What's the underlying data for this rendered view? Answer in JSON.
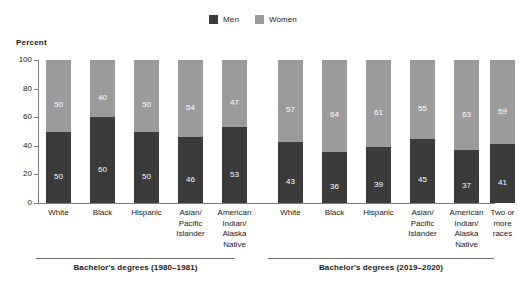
{
  "axis_title": "Percent",
  "legend": [
    {
      "label": "Men",
      "color": "#3b3b3b",
      "icon": "square-swatch-icon"
    },
    {
      "label": "Women",
      "color": "#9b9b9b",
      "icon": "square-swatch-icon"
    }
  ],
  "y_ticks": [
    "0",
    "20",
    "40",
    "60",
    "80",
    "100"
  ],
  "groups": [
    {
      "caption": "Bachelor's degrees (1980–1981)",
      "categories": [
        "White",
        "Black",
        "Hispanic",
        "Asian/\nPacific\nIslander",
        "American\nIndian/\nAlaska\nNative"
      ],
      "men": [
        50,
        60,
        50,
        46,
        53
      ],
      "women": [
        50,
        40,
        50,
        54,
        47
      ]
    },
    {
      "caption": "Bachelor's degrees (2019–2020)",
      "categories": [
        "White",
        "Black",
        "Hispanic",
        "Asian/\nPacific\nIslander",
        "American\nIndian/\nAlaska\nNative",
        "Two or\nmore\nraces"
      ],
      "men": [
        43,
        36,
        39,
        45,
        37,
        41
      ],
      "women": [
        57,
        64,
        61,
        55,
        63,
        59
      ]
    }
  ],
  "chart_data": {
    "type": "bar",
    "subtype": "stacked-100-percent-vertical",
    "title": "",
    "xlabel": "",
    "ylabel": "Percent",
    "ylim": [
      0,
      100
    ],
    "yticks": [
      0,
      20,
      40,
      60,
      80,
      100
    ],
    "grid": false,
    "legend_position": "top-center",
    "legend_entries": [
      "Men",
      "Women"
    ],
    "colors": {
      "Men": "#3b3b3b",
      "Women": "#9b9b9b"
    },
    "panels": [
      {
        "name": "Bachelor's degrees (1980–1981)",
        "categories": [
          "White",
          "Black",
          "Hispanic",
          "Asian/Pacific Islander",
          "American Indian/Alaska Native"
        ],
        "series": [
          {
            "name": "Men",
            "values": [
              50,
              60,
              50,
              46,
              53
            ]
          },
          {
            "name": "Women",
            "values": [
              50,
              40,
              50,
              54,
              47
            ]
          }
        ]
      },
      {
        "name": "Bachelor's degrees (2019–2020)",
        "categories": [
          "White",
          "Black",
          "Hispanic",
          "Asian/Pacific Islander",
          "American Indian/Alaska Native",
          "Two or more races"
        ],
        "series": [
          {
            "name": "Men",
            "values": [
              43,
              36,
              39,
              45,
              37,
              41
            ]
          },
          {
            "name": "Women",
            "values": [
              57,
              64,
              61,
              55,
              63,
              59
            ]
          }
        ]
      }
    ]
  },
  "layout": {
    "plot_left": 38,
    "plot_top": 60,
    "plot_height": 143,
    "bar_width": 25,
    "group1_bar_x": [
      8,
      52,
      96,
      140,
      184
    ],
    "group2_bar_x": [
      240,
      284,
      328,
      372,
      416,
      452
    ],
    "group1_rule": {
      "left": 36,
      "width": 199
    },
    "group2_rule": {
      "left": 268,
      "width": 226
    }
  }
}
